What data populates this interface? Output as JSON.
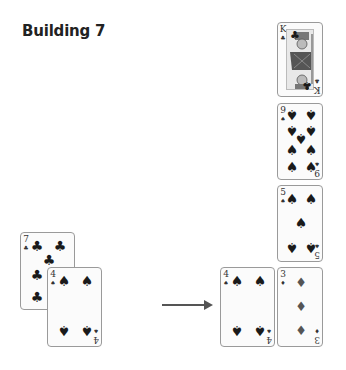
{
  "title": "Building 7",
  "arrow": {
    "direction": "right",
    "color": "#555555"
  },
  "cards": {
    "left_7_clubs": {
      "rank": "7",
      "suit": "♣",
      "suit_name": "clubs"
    },
    "left_4_spades": {
      "rank": "4",
      "suit": "♠",
      "suit_name": "spades"
    },
    "right_king_clubs": {
      "rank": "K",
      "suit": "♣",
      "suit_name": "clubs"
    },
    "right_9_spades": {
      "rank": "9",
      "suit": "♠",
      "suit_name": "spades"
    },
    "right_5_spades": {
      "rank": "5",
      "suit": "♠",
      "suit_name": "spades"
    },
    "right_4_spades": {
      "rank": "4",
      "suit": "♠",
      "suit_name": "spades"
    },
    "right_3_diamonds": {
      "rank": "3",
      "suit": "♦",
      "suit_name": "diamonds"
    }
  }
}
